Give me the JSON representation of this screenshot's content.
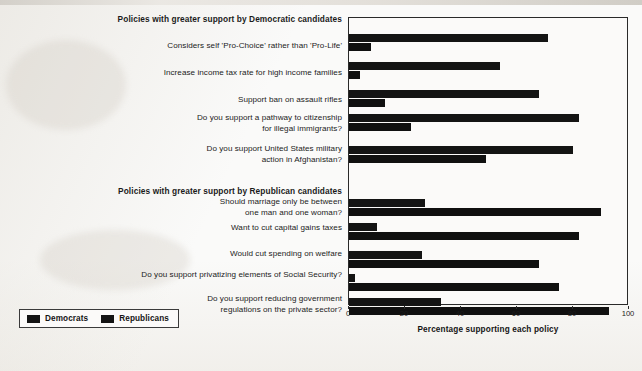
{
  "axis": {
    "title": "Percentage supporting each policy",
    "ticks": [
      {
        "value": 0,
        "label": "0"
      },
      {
        "value": 20,
        "label": "20"
      },
      {
        "value": 40,
        "label": "40"
      },
      {
        "value": 60,
        "label": "60"
      },
      {
        "value": 80,
        "label": "80"
      },
      {
        "value": 100,
        "label": "100"
      }
    ]
  },
  "legend": {
    "items": [
      {
        "label": "Democrats",
        "color": "#141414"
      },
      {
        "label": "Republicans",
        "color": "#101010"
      }
    ]
  },
  "sections": [
    {
      "key": "dem",
      "title": "Policies with greater support by Democratic candidates"
    },
    {
      "key": "rep",
      "title": "Policies with greater support by Republican candidates"
    }
  ],
  "chart_data": {
    "type": "bar",
    "orientation": "horizontal",
    "title": "",
    "xlabel": "Percentage supporting each policy",
    "ylabel": "",
    "xlim": [
      0,
      100
    ],
    "xticks": [
      0,
      20,
      40,
      60,
      80,
      100
    ],
    "grid": false,
    "legend_position": "bottom-left",
    "series": [
      {
        "name": "Democrats",
        "color": "#141414",
        "values": [
          71,
          54,
          68,
          82,
          80,
          27,
          10,
          26,
          2,
          33
        ]
      },
      {
        "name": "Republicans",
        "color": "#101010",
        "values": [
          8,
          4,
          13,
          22,
          49,
          90,
          82,
          68,
          75,
          93
        ]
      }
    ],
    "categories": [
      "Considers self 'Pro-Choice' rather than 'Pro-Life'",
      "Increase income tax rate for high income families",
      "Support ban on assault rifles",
      "Do you support a pathway to citizenship for illegal immigrants?",
      "Do you support United States military action in Afghanistan?",
      "Should marriage only be between one man and one woman?",
      "Want to cut capital gains taxes",
      "Would cut spending on welfare",
      "Do you support privatizing elements of Social Security?",
      "Do you support reducing government regulations on the private sector?"
    ],
    "groups": [
      {
        "section": "Policies with greater support by Democratic candidates",
        "rows": [
          {
            "label_lines": [
              "Considers self 'Pro-Choice' rather than 'Pro-Life'"
            ],
            "dem": 71,
            "rep": 8
          },
          {
            "label_lines": [
              "Increase income tax rate for high income families"
            ],
            "dem": 54,
            "rep": 4
          },
          {
            "label_lines": [
              "Support ban on assault rifles"
            ],
            "dem": 68,
            "rep": 13
          },
          {
            "label_lines": [
              "Do you support a pathway to citizenship",
              "for illegal immigrants?"
            ],
            "dem": 82,
            "rep": 22
          },
          {
            "label_lines": [
              "Do you support United States military",
              "action in Afghanistan?"
            ],
            "dem": 80,
            "rep": 49
          }
        ]
      },
      {
        "section": "Policies with greater support by Republican candidates",
        "rows": [
          {
            "label_lines": [
              "Should marriage only be between",
              "one man and one woman?"
            ],
            "dem": 27,
            "rep": 90
          },
          {
            "label_lines": [
              "Want to cut capital gains taxes"
            ],
            "dem": 10,
            "rep": 82
          },
          {
            "label_lines": [
              "Would cut spending on welfare"
            ],
            "dem": 26,
            "rep": 68
          },
          {
            "label_lines": [
              "Do you support privatizing elements of Social Security?"
            ],
            "dem": 2,
            "rep": 75
          },
          {
            "label_lines": [
              "Do you support reducing government",
              "regulations on the private sector?"
            ],
            "dem": 33,
            "rep": 93
          }
        ]
      }
    ]
  }
}
